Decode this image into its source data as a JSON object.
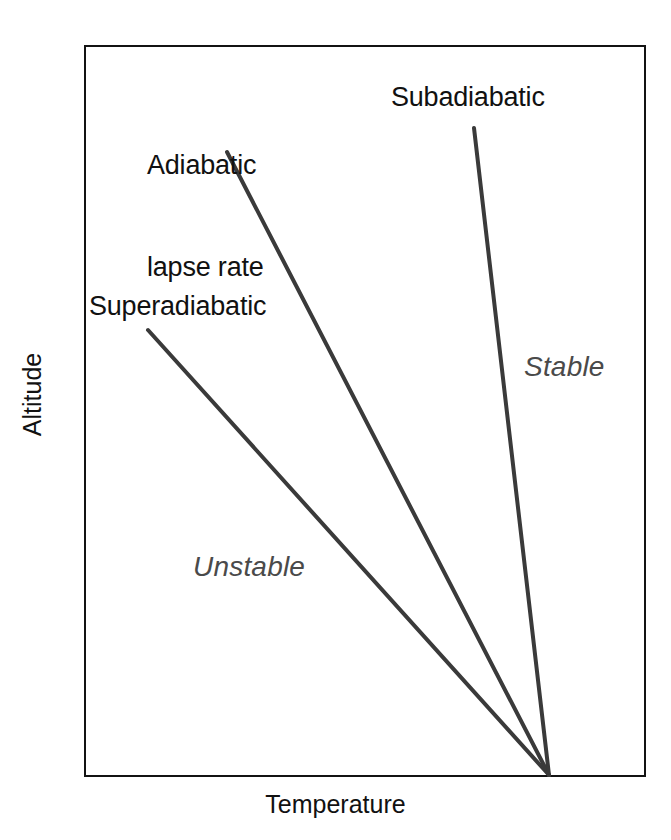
{
  "chart_data": {
    "type": "line",
    "title": "",
    "xlabel": "Temperature",
    "ylabel": "Altitude",
    "grid": false,
    "legend_position": "inline-annotations",
    "axis_ticks": "none",
    "plot_box": {
      "x0": 84,
      "y0": 45,
      "x1": 646,
      "y1": 777
    },
    "origin_point": {
      "x": 549,
      "y": 775
    },
    "series": [
      {
        "name": "Superadiabatic",
        "color": "#3a3a3a",
        "width": 4,
        "points": [
          [
            148,
            330
          ],
          [
            549,
            775
          ]
        ],
        "region": "Unstable"
      },
      {
        "name": "Adiabatic lapse rate",
        "color": "#3a3a3a",
        "width": 4,
        "points": [
          [
            227,
            152
          ],
          [
            549,
            775
          ]
        ],
        "region": "neutral"
      },
      {
        "name": "Subadiabatic",
        "color": "#3a3a3a",
        "width": 4,
        "points": [
          [
            474,
            128
          ],
          [
            549,
            775
          ]
        ],
        "region": "Stable"
      }
    ],
    "annotations": [
      {
        "text": "Adiabatic lapse rate",
        "x": 147,
        "y": 80,
        "style": "regular"
      },
      {
        "text": "Subadiabatic",
        "x": 391,
        "y": 80,
        "style": "regular"
      },
      {
        "text": "Superadiabatic",
        "x": 89,
        "y": 289,
        "style": "regular"
      },
      {
        "text": "Stable",
        "x": 524,
        "y": 351,
        "style": "italic"
      },
      {
        "text": "Unstable",
        "x": 193,
        "y": 551,
        "style": "italic"
      }
    ]
  },
  "axes": {
    "y_title": "Altitude",
    "x_title": "Temperature"
  },
  "labels": {
    "adiabatic_line1": "Adiabatic",
    "adiabatic_line2": "lapse rate",
    "subadiabatic": "Subadiabatic",
    "superadiabatic": "Superadiabatic",
    "stable": "Stable",
    "unstable": "Unstable"
  },
  "colors": {
    "background": "#ffffff",
    "frame": "#131313",
    "line": "#3a3a3a",
    "label_text": "#111111",
    "region_text": "#4a4a4a"
  }
}
